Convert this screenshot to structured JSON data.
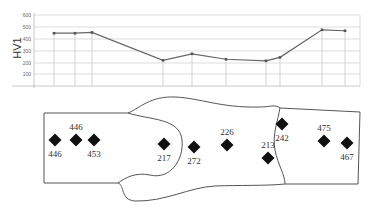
{
  "chart_data": [
    {
      "type": "line",
      "title": "",
      "xlabel": "",
      "ylabel": "HV1",
      "ylim": [
        0,
        600
      ],
      "yticks": [
        100,
        200,
        300,
        400,
        500,
        600
      ],
      "grid": true,
      "legend": "none",
      "x_positions_px": [
        54,
        75,
        92,
        163,
        192,
        226,
        266,
        280,
        322,
        345
      ],
      "series": [
        {
          "name": "HV1",
          "values": [
            446,
            446,
            453,
            217,
            272,
            226,
            213,
            242,
            475,
            467
          ]
        }
      ]
    },
    {
      "type": "diagram",
      "title": "Weld cross-section hardness indentation locations",
      "points": [
        {
          "label": "446",
          "x": 55,
          "y": 140,
          "label_pos": "below"
        },
        {
          "label": "446",
          "x": 76,
          "y": 140,
          "label_pos": "above"
        },
        {
          "label": "453",
          "x": 94,
          "y": 140,
          "label_pos": "below"
        },
        {
          "label": "217",
          "x": 164,
          "y": 144,
          "label_pos": "below"
        },
        {
          "label": "272",
          "x": 194,
          "y": 147,
          "label_pos": "below"
        },
        {
          "label": "226",
          "x": 227,
          "y": 145,
          "label_pos": "above"
        },
        {
          "label": "213",
          "x": 268,
          "y": 158,
          "label_pos": "above"
        },
        {
          "label": "242",
          "x": 282,
          "y": 124,
          "label_pos": "below"
        },
        {
          "label": "475",
          "x": 324,
          "y": 141,
          "label_pos": "above"
        },
        {
          "label": "467",
          "x": 347,
          "y": 143,
          "label_pos": "below"
        }
      ]
    }
  ],
  "axis": {
    "ylabel": "HV1",
    "ticks": [
      "100",
      "200",
      "300",
      "400",
      "500",
      "600"
    ]
  },
  "labels": [
    "446",
    "446",
    "453",
    "217",
    "272",
    "226",
    "213",
    "242",
    "475",
    "467"
  ]
}
